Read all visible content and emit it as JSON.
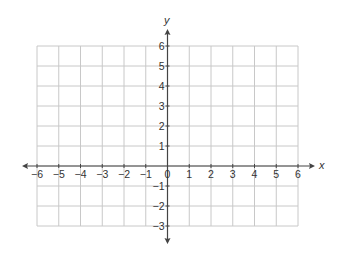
{
  "diagram": {
    "type": "coordinate-plane",
    "x_axis": {
      "label": "x",
      "min": -6,
      "max": 6,
      "ticks": [
        "−6",
        "−5",
        "−4",
        "−3",
        "−2",
        "−1",
        "0",
        "1",
        "2",
        "3",
        "4",
        "5",
        "6"
      ]
    },
    "y_axis": {
      "label": "y",
      "min": -3,
      "max": 6,
      "ticks": [
        "6",
        "5",
        "4",
        "3",
        "2",
        "1",
        "−1",
        "−2",
        "−3"
      ]
    },
    "grid": true,
    "colors": {
      "grid": "#c8c8c8",
      "axis": "#444444",
      "text": "#333333"
    }
  }
}
